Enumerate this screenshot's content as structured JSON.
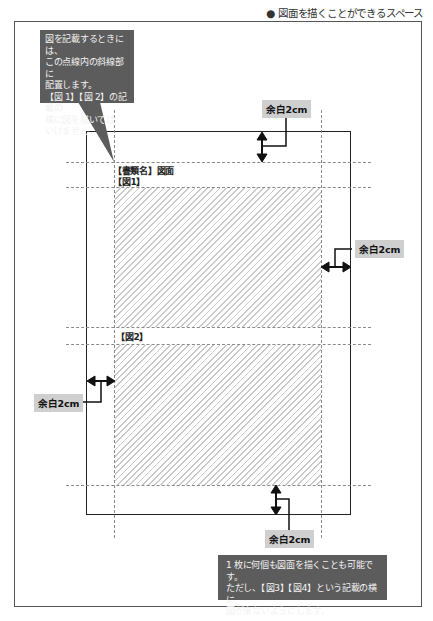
{
  "header": {
    "title": "● 図面を描くことができるスペース"
  },
  "document": {
    "doc_name_label": "【書類名】図面",
    "figure_1_label": "【図1】",
    "figure_2_label": "【図2】"
  },
  "margins": {
    "top_label": "余白2cm",
    "right_label": "余白2cm",
    "left_label": "余白2cm",
    "bottom_label": "余白2cm"
  },
  "callouts": {
    "top_note": {
      "lines": [
        "図を記載するときには、",
        "この点線内の斜線部に",
        "配置します。",
        "【図 1】【図 2】の記載の",
        "横に図を描いては",
        "いけません。"
      ]
    },
    "bottom_note": {
      "lines": [
        "1 枚に何個も図面を描くことも可能です。",
        "ただし、【図3】【図4】という記載の横に",
        "図が来ないようにします。"
      ]
    }
  },
  "colors": {
    "callout_bg": "#5c5c5c",
    "label_bg": "#cfcfcf",
    "hatch": "#c9c9c9",
    "dash": "#8a8a8a"
  }
}
